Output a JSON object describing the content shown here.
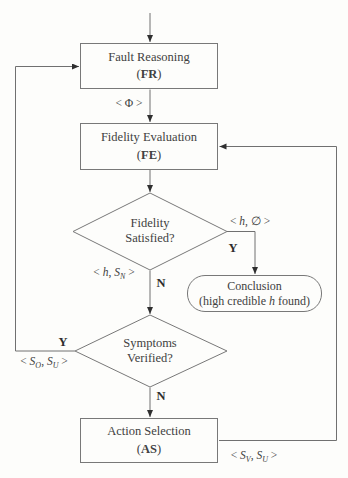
{
  "figure": {
    "type": "flowchart",
    "background": "#fdfdfb",
    "line_color": "#707070",
    "border_color": "#787878",
    "text_color": "#414141",
    "nodes": {
      "fault_reasoning": {
        "title": "Fault Reasoning",
        "paren_open": "(",
        "abbr": "FR",
        "paren_close": ")"
      },
      "fidelity_evaluation": {
        "title": "Fidelity Evaluation",
        "paren_open": "(",
        "abbr": "FE",
        "paren_close": ")"
      },
      "fidelity_satisfied": {
        "line1": "Fidelity",
        "line2": "Satisfied?"
      },
      "symptoms_verified": {
        "line1": "Symptoms",
        "line2": "Verified?"
      },
      "action_selection": {
        "title": "Action Selection",
        "paren_open": "(",
        "abbr": "AS",
        "paren_close": ")"
      },
      "conclusion": {
        "title": "Conclusion",
        "detail_pre": "(high credible ",
        "detail_var": "h",
        "detail_post": " found)"
      }
    },
    "edge_labels": {
      "phi": "< Φ >",
      "h_empty_pre": "< ",
      "h_empty_var": "h",
      "h_empty_post": ", ∅ >",
      "h_sn_pre": "< ",
      "h_sn_var1": "h",
      "h_sn_mid": ", ",
      "h_sn_var2": "S",
      "h_sn_sub": "N",
      "h_sn_post": " >",
      "so_su_pre": "< ",
      "so_su_var1": "S",
      "so_su_sub1": "O",
      "so_su_mid": ", ",
      "so_su_var2": "S",
      "so_su_sub2": "U",
      "so_su_post": " >",
      "sv_su_pre": "< ",
      "sv_su_var1": "S",
      "sv_su_sub1": "V",
      "sv_su_mid": ", ",
      "sv_su_var2": "S",
      "sv_su_sub2": "U",
      "sv_su_post": " >",
      "yes": "Y",
      "no": "N"
    }
  }
}
